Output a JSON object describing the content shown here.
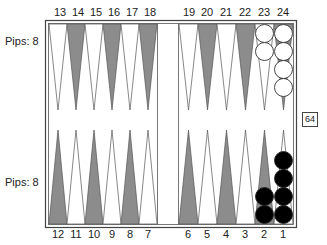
{
  "labels": {
    "top_points": [
      "13",
      "14",
      "15",
      "16",
      "17",
      "18",
      "19",
      "20",
      "21",
      "22",
      "23",
      "24"
    ],
    "bottom_points": [
      "12",
      "11",
      "10",
      "9",
      "8",
      "7",
      "6",
      "5",
      "4",
      "3",
      "2",
      "1"
    ],
    "pips_top": "Pips: 8",
    "pips_bottom": "Pips: 8"
  },
  "cube": {
    "value": "64"
  },
  "colors": {
    "dark_point": "#8c8c8c",
    "light_point": "#ffffff",
    "frame": "#444444",
    "white_checker": "#ffffff",
    "black_checker": "#000000"
  },
  "checkers": {
    "white": [
      {
        "point": 23,
        "count": 2
      },
      {
        "point": 24,
        "count": 4
      }
    ],
    "black": [
      {
        "point": 2,
        "count": 2
      },
      {
        "point": 1,
        "count": 4
      }
    ]
  }
}
